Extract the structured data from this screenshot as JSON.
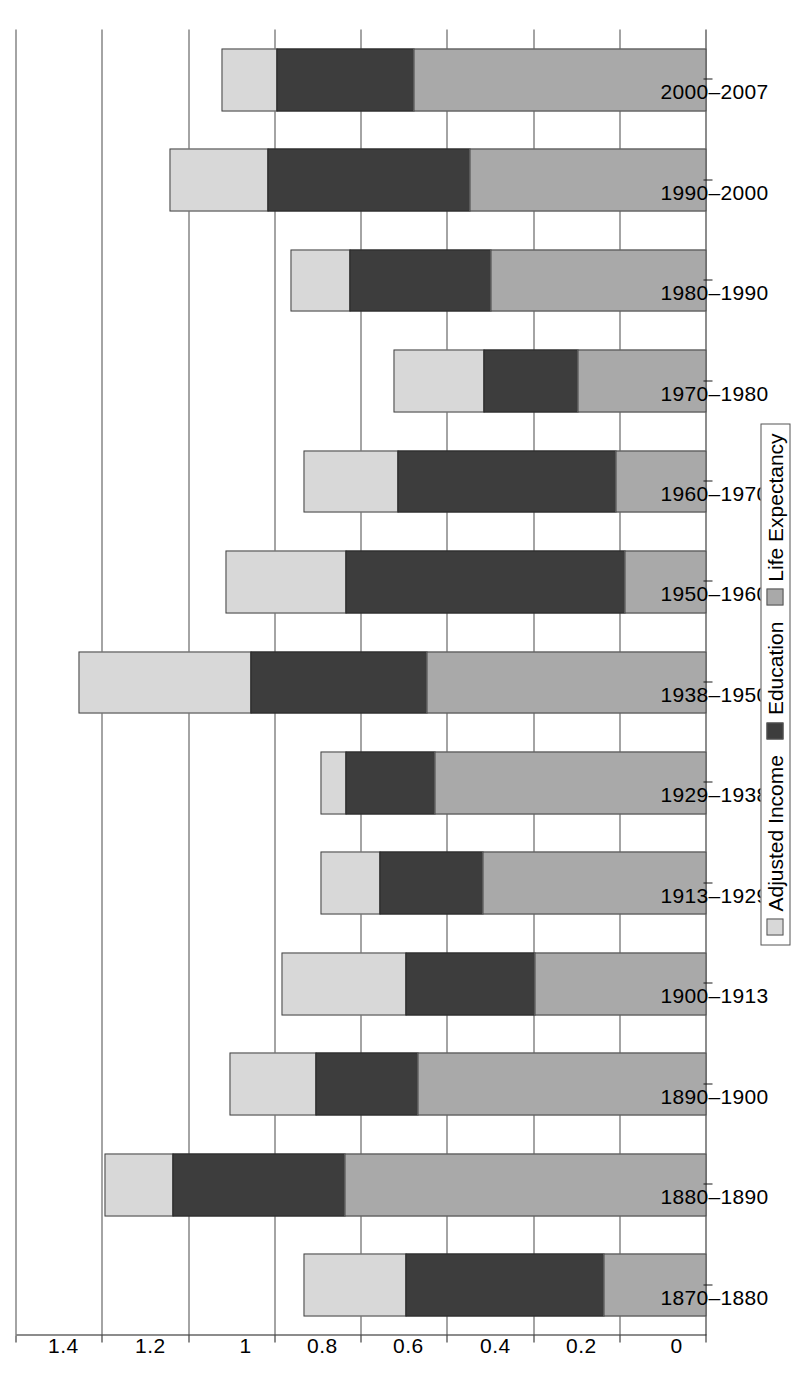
{
  "chart_data": {
    "type": "bar",
    "orientation": "horizontal",
    "stacked": true,
    "title": "",
    "xlabel": "",
    "ylabel": "",
    "ylim": [
      0,
      1.6
    ],
    "grid": true,
    "legend_position": "bottom",
    "tick_labels": [
      "0",
      "0.2",
      "0.4",
      "0.6",
      "0.8",
      "1",
      "1.2",
      "1.4",
      "1.6"
    ],
    "tick_values": [
      0,
      0.2,
      0.4,
      0.6,
      0.8,
      1,
      1.2,
      1.4,
      1.6
    ],
    "categories": [
      "1870–1880",
      "1880–1890",
      "1890–1900",
      "1900–1913",
      "1913–1929",
      "1929–1938",
      "1938–1950",
      "1950–1960",
      "1960–1970",
      "1970–1980",
      "1980–1990",
      "1990–2000",
      "2000–2007"
    ],
    "series": [
      {
        "name": "Life Expectancy",
        "color": "#a9a9a9",
        "values": [
          0.24,
          0.84,
          0.67,
          0.4,
          0.52,
          0.63,
          0.65,
          0.19,
          0.21,
          0.3,
          0.5,
          0.55,
          0.68
        ]
      },
      {
        "name": "Education",
        "color": "#3d3d3d",
        "values": [
          0.46,
          0.4,
          0.24,
          0.3,
          0.24,
          0.21,
          0.41,
          0.65,
          0.51,
          0.22,
          0.33,
          0.47,
          0.32
        ]
      },
      {
        "name": "Adjusted Income",
        "color": "#d8d8d8",
        "values": [
          0.24,
          0.16,
          0.2,
          0.29,
          0.14,
          0.06,
          0.4,
          0.28,
          0.22,
          0.21,
          0.14,
          0.23,
          0.13
        ]
      }
    ],
    "totals": [
      0.94,
      1.4,
      1.11,
      0.99,
      0.9,
      0.9,
      1.46,
      1.12,
      0.94,
      0.73,
      0.97,
      1.25,
      1.13
    ]
  },
  "legend": {
    "entries": [
      {
        "label": "Adjusted Income",
        "swatch": "swatch-adjusted-income",
        "color": "#d8d8d8"
      },
      {
        "label": "Education",
        "swatch": "swatch-education",
        "color": "#3d3d3d"
      },
      {
        "label": "Life Expectancy",
        "swatch": "swatch-life-expectancy",
        "color": "#a9a9a9"
      }
    ]
  },
  "colors": {
    "adjusted_income": "#d8d8d8",
    "education": "#3d3d3d",
    "life_expectancy": "#a9a9a9",
    "axis": "#1a1a1a",
    "grid": "#4a4a4a",
    "background": "#ffffff"
  }
}
